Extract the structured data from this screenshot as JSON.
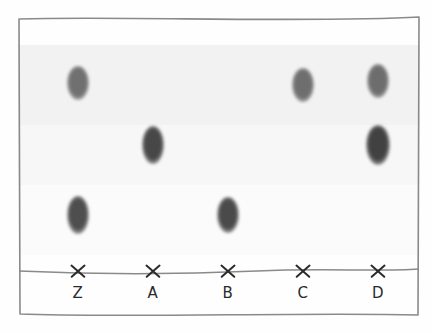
{
  "figure": {
    "type": "tlc-plate",
    "plate": {
      "border_color": "#8a8a8a",
      "background_color": "#fdfdfd",
      "left": 17,
      "top": 15,
      "width": 404,
      "height": 304
    },
    "baseline": {
      "label": "origin-baseline",
      "y": 257,
      "color": "#8a8a8a"
    },
    "lanes": [
      {
        "id": "lane-z",
        "label": "Z",
        "x": 61,
        "origin_mark": "x-mark",
        "spots": [
          {
            "name": "spot-z-top",
            "y": 68,
            "rf": 0.79,
            "rx": 11,
            "ry": 17,
            "color": "#707070",
            "intensity": "medium"
          },
          {
            "name": "spot-z-bottom",
            "y": 200,
            "rf": 0.27,
            "rx": 11,
            "ry": 19,
            "color": "#4e4e4e",
            "intensity": "strong"
          }
        ]
      },
      {
        "id": "lane-a",
        "label": "A",
        "x": 136,
        "origin_mark": "x-mark",
        "spots": [
          {
            "name": "spot-a-middle",
            "y": 130,
            "rf": 0.53,
            "rx": 11,
            "ry": 19,
            "color": "#474747",
            "intensity": "strong"
          }
        ]
      },
      {
        "id": "lane-b",
        "label": "B",
        "x": 211,
        "origin_mark": "x-mark",
        "spots": [
          {
            "name": "spot-b-bottom",
            "y": 200,
            "rf": 0.27,
            "rx": 11,
            "ry": 18,
            "color": "#4a4a4a",
            "intensity": "strong"
          }
        ]
      },
      {
        "id": "lane-c",
        "label": "C",
        "x": 286,
        "origin_mark": "x-mark",
        "spots": [
          {
            "name": "spot-c-top",
            "y": 70,
            "rf": 0.78,
            "rx": 11,
            "ry": 17,
            "color": "#6e6e6e",
            "intensity": "medium"
          }
        ]
      },
      {
        "id": "lane-d",
        "label": "D",
        "x": 361,
        "origin_mark": "x-mark",
        "spots": [
          {
            "name": "spot-d-top",
            "y": 66,
            "rf": 0.8,
            "rx": 11,
            "ry": 17,
            "color": "#6d6d6d",
            "intensity": "medium"
          },
          {
            "name": "spot-d-middle",
            "y": 130,
            "rf": 0.53,
            "rx": 12,
            "ry": 20,
            "color": "#414141",
            "intensity": "strong"
          }
        ]
      }
    ]
  },
  "chart_data": {
    "type": "scatter",
    "xlabel": "",
    "ylabel": "Rf",
    "categories": [
      "Z",
      "A",
      "B",
      "C",
      "D"
    ],
    "ylim": [
      0,
      1
    ],
    "grid": false,
    "legend": "none",
    "series": [
      {
        "name": "Z",
        "points": [
          {
            "rf": 0.79,
            "intensity": "medium"
          },
          {
            "rf": 0.27,
            "intensity": "strong"
          }
        ]
      },
      {
        "name": "A",
        "points": [
          {
            "rf": 0.53,
            "intensity": "strong"
          }
        ]
      },
      {
        "name": "B",
        "points": [
          {
            "rf": 0.27,
            "intensity": "strong"
          }
        ]
      },
      {
        "name": "C",
        "points": [
          {
            "rf": 0.78,
            "intensity": "medium"
          }
        ]
      },
      {
        "name": "D",
        "points": [
          {
            "rf": 0.8,
            "intensity": "medium"
          },
          {
            "rf": 0.53,
            "intensity": "strong"
          }
        ]
      }
    ]
  }
}
